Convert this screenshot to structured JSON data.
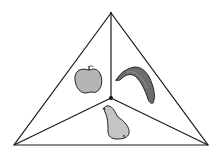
{
  "diagram": {
    "type": "triangle-partition",
    "regions": [
      {
        "label": "apple",
        "icon": "apple-icon",
        "position": "left"
      },
      {
        "label": "banana",
        "icon": "banana-icon",
        "position": "right"
      },
      {
        "label": "pear",
        "icon": "pear-icon",
        "position": "bottom"
      }
    ],
    "colors": {
      "stroke": "#1a1a1a",
      "apple_fill": "#b5b5b5",
      "banana_fill": "#6e6e6e",
      "pear_fill": "#c4c4c4",
      "background": "#ffffff"
    }
  }
}
